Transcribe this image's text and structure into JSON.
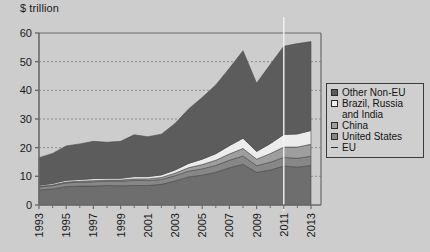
{
  "chart_data": {
    "type": "area",
    "title": "",
    "ylabel": "$ trillion",
    "xlabel": "",
    "ylim": [
      0,
      60
    ],
    "yticks": [
      0,
      10,
      20,
      30,
      40,
      50,
      60
    ],
    "ytick_labels": [
      "0",
      "10",
      "20",
      "30",
      "40",
      "50",
      "60"
    ],
    "grid": true,
    "legend_position": "right",
    "stacked": true,
    "x": [
      1993,
      1994,
      1995,
      1996,
      1997,
      1998,
      1999,
      2000,
      2001,
      2002,
      2003,
      2004,
      2005,
      2006,
      2007,
      2008,
      2009,
      2010,
      2011,
      2012,
      2013
    ],
    "xtick_labels": [
      "1993",
      "1995",
      "1997",
      "1999",
      "2001",
      "2003",
      "2005",
      "2007",
      "2009",
      "2011",
      "2013"
    ],
    "xticks": [
      1993,
      1995,
      1997,
      1999,
      2001,
      2003,
      2005,
      2007,
      2009,
      2011,
      2013
    ],
    "series": [
      {
        "name": "EU",
        "color": "#6e6e6e",
        "values": [
          5.2,
          5.6,
          6.4,
          6.6,
          6.6,
          6.8,
          6.7,
          6.8,
          6.8,
          7.2,
          8.4,
          9.8,
          10.4,
          11.4,
          13.0,
          14.2,
          11.4,
          12.2,
          13.6,
          13.2,
          13.8
        ]
      },
      {
        "name": "United States",
        "color": "#878787",
        "values": [
          1.1,
          1.2,
          1.3,
          1.4,
          1.5,
          1.5,
          1.6,
          1.8,
          1.7,
          1.7,
          1.8,
          2.0,
          2.2,
          2.4,
          2.6,
          2.9,
          2.3,
          2.7,
          3.0,
          3.1,
          3.2
        ]
      },
      {
        "name": "China",
        "color": "#9e9e9e",
        "values": [
          0.2,
          0.2,
          0.3,
          0.3,
          0.4,
          0.4,
          0.4,
          0.5,
          0.6,
          0.7,
          0.9,
          1.2,
          1.5,
          1.8,
          2.2,
          2.6,
          2.3,
          3.0,
          3.6,
          3.9,
          4.2
        ]
      },
      {
        "name": "Brazil, Russia and India",
        "color": "#ececec",
        "values": [
          0.4,
          0.5,
          0.6,
          0.6,
          0.7,
          0.6,
          0.6,
          0.8,
          0.8,
          0.9,
          1.1,
          1.5,
          1.9,
          2.3,
          2.9,
          3.6,
          2.7,
          3.5,
          4.4,
          4.6,
          4.8
        ]
      },
      {
        "name": "Other Non-EU",
        "color": "#5c5c5c",
        "values": [
          9.6,
          10.5,
          12.0,
          12.4,
          13.0,
          12.6,
          12.9,
          14.6,
          13.9,
          14.2,
          16.2,
          19.0,
          21.5,
          24.0,
          27.0,
          30.5,
          23.8,
          27.6,
          30.8,
          31.5,
          31.0
        ]
      }
    ],
    "totals": [
      16.5,
      18.0,
      20.6,
      21.3,
      22.2,
      21.9,
      22.2,
      24.5,
      23.8,
      24.7,
      28.4,
      33.5,
      37.5,
      41.9,
      47.7,
      53.8,
      42.5,
      49.0,
      55.4,
      56.3,
      57.0
    ],
    "divider_year": 2011
  },
  "legend": {
    "items": [
      {
        "label": "Other Non-EU",
        "marker": "square",
        "fill": "#5c5c5c"
      },
      {
        "label": "Brazil, Russia",
        "label2": "and India",
        "marker": "square",
        "fill": "#ececec"
      },
      {
        "label": "China",
        "marker": "square",
        "fill": "#9e9e9e"
      },
      {
        "label": "United States",
        "marker": "square",
        "fill": "#878787"
      },
      {
        "label": "EU",
        "marker": "line",
        "fill": "#6e6e6e"
      }
    ]
  },
  "colors": {
    "background": "#cdcdcd",
    "axis": "#6a6a6a",
    "text": "#141414",
    "gridline": "#8e8e8e",
    "divider": "#f2f2f2"
  }
}
